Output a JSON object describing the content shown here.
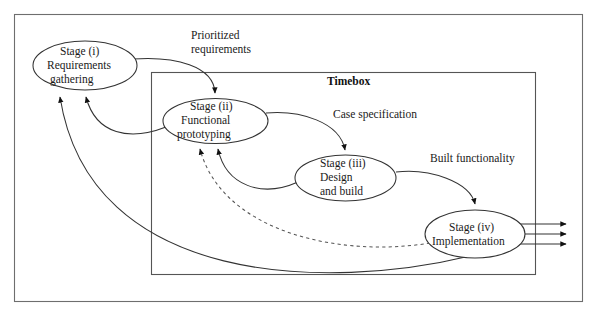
{
  "figure": {
    "background_color": "#ffffff",
    "border_color": "#6e6e6e",
    "line_color": "#333333",
    "text_color": "#1a1a1a"
  },
  "container": {
    "label": "Timebox",
    "border_color": "#555555"
  },
  "nodes": [
    {
      "id": "stage-i",
      "lines": [
        "Stage (i)",
        "Requirements",
        "gathering"
      ],
      "line1": "Stage (i)",
      "line2": "Requirements",
      "line3": "gathering"
    },
    {
      "id": "stage-ii",
      "lines": [
        "Stage (ii)",
        "Functional",
        "prototyping"
      ],
      "line1": "Stage (ii)",
      "line2": "Functional",
      "line3": "prototyping"
    },
    {
      "id": "stage-iii",
      "lines": [
        "Stage (iii)",
        "Design",
        "and build"
      ],
      "line1": "Stage (iii)",
      "line2": "Design",
      "line3": "and build"
    },
    {
      "id": "stage-iv",
      "lines": [
        "Stage (iv)",
        "Implementation"
      ],
      "line1": "Stage (iv)",
      "line2": "Implementation"
    }
  ],
  "edge_labels": {
    "prioritized_requirements_line1": "Prioritized",
    "prioritized_requirements_line2": "requirements",
    "case_specification": "Case specification",
    "built_functionality": "Built functionality"
  }
}
